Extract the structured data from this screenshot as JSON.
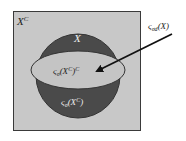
{
  "diagram": {
    "type": "venn-set-diagram",
    "colors": {
      "universe_fill": "#c8c8c8",
      "set_fill": "#4a4a4a",
      "inner_fill": "#c4c4c4",
      "border": "#3a3a3a",
      "arrow": "#111111",
      "dark_text": "#222222",
      "light_text": "#f0f0f0"
    },
    "labels": {
      "universe_complement": "X",
      "universe_complement_sup": "C",
      "set_x": "X",
      "inner_region_main": "ς",
      "inner_region_sub": "σ",
      "inner_region_arg": "(X",
      "inner_region_arg_sup": "C",
      "inner_region_close": ")",
      "inner_region_sup": "C",
      "lower_region_main": "ς",
      "lower_region_sub": "σ",
      "lower_region_arg": "(X",
      "lower_region_arg_sup": "C",
      "lower_region_close": ")",
      "callout_main": "ς",
      "callout_sub": "σd",
      "callout_arg": "(X)"
    }
  }
}
